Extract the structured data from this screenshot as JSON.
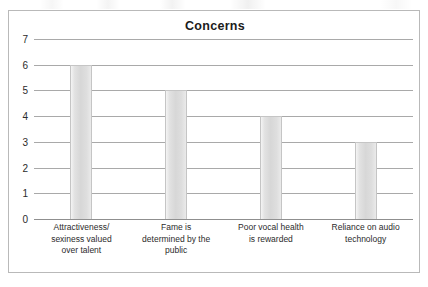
{
  "chart_data": {
    "type": "bar",
    "title": "Concerns",
    "xlabel": "",
    "ylabel": "",
    "ylim": [
      0,
      7
    ],
    "ytick_labels": [
      "7",
      "6",
      "5",
      "4",
      "3",
      "2",
      "1",
      "0"
    ],
    "yticks": [
      7,
      6,
      5,
      4,
      3,
      2,
      1,
      0
    ],
    "grid": true,
    "legend": false,
    "categories": [
      "Attractiveness/ sexiness valued over talent",
      "Fame is determined by the public",
      "Poor vocal health is rewarded",
      "Reliance on audio technology"
    ],
    "category_lines": [
      [
        "Attractiveness/",
        "sexiness valued",
        "over talent"
      ],
      [
        "Fame is",
        "determined by the",
        "public"
      ],
      [
        "Poor vocal health",
        "is rewarded"
      ],
      [
        "Reliance on audio",
        "technology"
      ]
    ],
    "values": [
      6,
      5,
      4,
      3
    ],
    "colors": {
      "bar_fill": "#dcdcdc",
      "bar_border": "#c5c5c5",
      "gridline": "#a9a9a9",
      "axis": "#8f8f8f",
      "frame_border": "#b9b9b9",
      "text": "#2b2b2b",
      "title_text": "#1b1b1b",
      "background": "#ffffff"
    }
  }
}
